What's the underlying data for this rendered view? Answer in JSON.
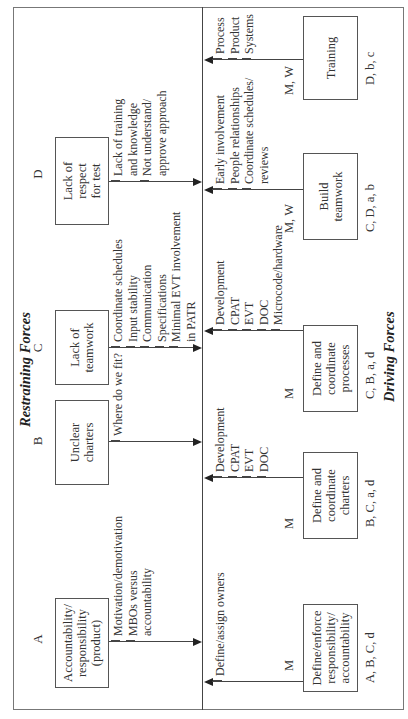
{
  "titles": {
    "restraining": "Restraining Forces",
    "driving": "Driving Forces"
  },
  "restraining_forces": [
    {
      "letter": "A",
      "label": "Accountability/\nresponsibility\n(product)",
      "factors": [
        "Motivation/demotivation",
        "MBOs versus\naccountability"
      ]
    },
    {
      "letter": "B",
      "label": "Unclear\ncharters",
      "factors": [
        "Where do we fit?"
      ]
    },
    {
      "letter": "C",
      "label": "Lack of\nteamwork",
      "factors": [
        "Coordinate schedules",
        "Input stability",
        "Communication",
        "Specifications",
        "Minimal EVT involvement\nin PATR"
      ]
    },
    {
      "letter": "D",
      "label": "Lack of\nrespect\nfor test",
      "factors": [
        "Lack of training\nand knowledge",
        "Not understand/\napprove approach"
      ]
    }
  ],
  "driving_forces": [
    {
      "label": "Define/enforce\nresponsibility/\naccountability",
      "owner": "M",
      "addresses": "A, B, C, d",
      "factors": [
        "Define/assign owners"
      ]
    },
    {
      "label": "Define and\ncoordinate\ncharters",
      "owner": "M",
      "addresses": "B, C, a, d",
      "factors": [
        "Development",
        "CPAT",
        "EVT",
        "DOC"
      ]
    },
    {
      "label": "Define and\ncoordinate\nprocesses",
      "owner": "M",
      "addresses": "C, B, a, d",
      "factors": [
        "Development",
        "CPAT",
        "EVT",
        "DOC",
        "Microcode/hardware"
      ]
    },
    {
      "label": "Build\nteamwork",
      "owner": "M, W",
      "addresses": "C, D, a, b",
      "factors": [
        "Early involvement",
        "People relationships",
        "Coordinate schedules/\nreviews"
      ]
    },
    {
      "label": "Training",
      "owner": "M, W",
      "addresses": "D, b, c",
      "factors": [
        "Process",
        "Product",
        "Systems"
      ]
    }
  ]
}
